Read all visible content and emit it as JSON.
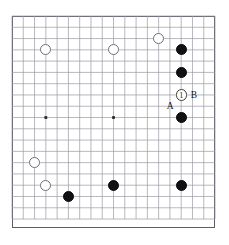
{
  "figure": {
    "kind": "go-board-diagram",
    "board_size": 19,
    "origin_x": 12,
    "origin_y": 16,
    "cell": 11.28,
    "line_color": "#9a9aa4",
    "border_color": "#5c5c64",
    "black_color": "#111114",
    "white_color": "#ffffff",
    "white_edge_color": "#6f6f78",
    "background": "#ffffff"
  },
  "star_points": [
    {
      "col": 3,
      "row": 9
    },
    {
      "col": 9,
      "row": 9
    }
  ],
  "stones": [
    {
      "id": "w-c3-r3",
      "color": "white",
      "col": 3,
      "row": 3,
      "label": ""
    },
    {
      "id": "w-c9-r3",
      "color": "white",
      "col": 9,
      "row": 3,
      "label": ""
    },
    {
      "id": "w-c13-r2",
      "color": "white",
      "col": 13,
      "row": 2,
      "label": ""
    },
    {
      "id": "b-c15-r3",
      "color": "black",
      "col": 15,
      "row": 3,
      "label": ""
    },
    {
      "id": "b-c15-r5",
      "color": "black",
      "col": 15,
      "row": 5,
      "label": ""
    },
    {
      "id": "w-c15-r7",
      "color": "white",
      "col": 15,
      "row": 7,
      "label": "1"
    },
    {
      "id": "b-c15-r9",
      "color": "black",
      "col": 15,
      "row": 9,
      "label": ""
    },
    {
      "id": "w-c2-r13",
      "color": "white",
      "col": 2,
      "row": 13,
      "label": ""
    },
    {
      "id": "w-c3-r15",
      "color": "white",
      "col": 3,
      "row": 15,
      "label": ""
    },
    {
      "id": "b-c5-r16",
      "color": "black",
      "col": 5,
      "row": 16,
      "label": ""
    },
    {
      "id": "b-c9-r15",
      "color": "black",
      "col": 9,
      "row": 15,
      "label": ""
    },
    {
      "id": "b-c15-r15",
      "color": "black",
      "col": 15,
      "row": 15,
      "label": ""
    }
  ],
  "point_labels": [
    {
      "id": "label-b",
      "text": "B",
      "col": 16,
      "row": 7,
      "dx": 1.5,
      "dy": 0
    },
    {
      "id": "label-a",
      "text": "A",
      "col": 14,
      "row": 8,
      "dx": 0,
      "dy": 0
    }
  ],
  "move_number": "1"
}
